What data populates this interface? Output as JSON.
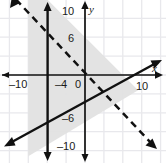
{
  "chart_data": {
    "type": "line",
    "title": "",
    "xlabel": "x",
    "ylabel": "y",
    "xlim": [
      -12,
      12
    ],
    "ylim": [
      -12,
      12
    ],
    "grid": true,
    "grid_step": 2,
    "legend": "none",
    "x_ticks": [
      {
        "value": -10,
        "label": "–10"
      },
      {
        "value": -4,
        "label": "–4"
      },
      {
        "value": 0,
        "label": "0"
      },
      {
        "value": 10,
        "label": "10"
      }
    ],
    "y_ticks": [
      {
        "value": 10,
        "label": "10"
      },
      {
        "value": 6,
        "label": "6"
      },
      {
        "value": -6,
        "label": "–6"
      },
      {
        "value": -10,
        "label": "–10"
      }
    ],
    "series": [
      {
        "name": "vertical-boundary",
        "style": "solid",
        "equation": "x = -6",
        "arrows": "both",
        "points": [
          [
            -6,
            -12
          ],
          [
            -6,
            12
          ]
        ]
      },
      {
        "name": "dashed-boundary",
        "style": "dashed",
        "equation": "y = -x + 4",
        "arrows": "both",
        "points": [
          [
            -12,
            16
          ],
          [
            12,
            -8
          ]
        ]
      },
      {
        "name": "solid-diagonal-boundary",
        "style": "solid",
        "equation": "y = 0.6x - 5",
        "arrows": "both",
        "points": [
          [
            -12,
            -12.2
          ],
          [
            12,
            2.2
          ]
        ]
      }
    ],
    "shaded_region": {
      "fill": "#e2e2e2",
      "description": "Region right of x = -6, below the dashed line, above the solid diagonal line"
    },
    "colors": {
      "axis": "#111111",
      "grid": "#e6e6ea",
      "line": "#111111",
      "shade": "#e2e2e2",
      "background": "#ffffff",
      "text": "#1a1a1a"
    }
  }
}
